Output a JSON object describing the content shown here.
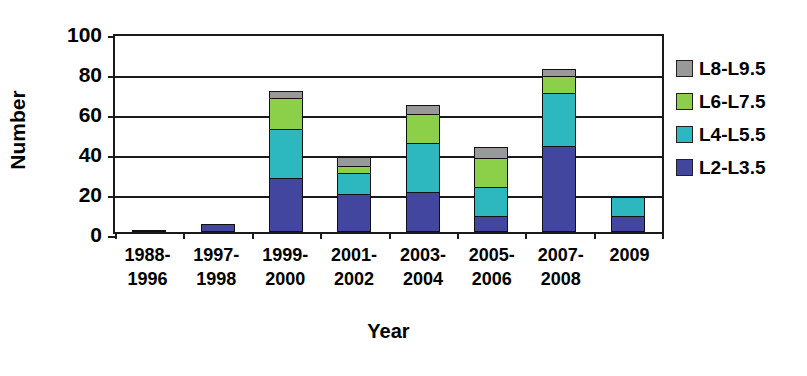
{
  "chart_data": {
    "type": "bar",
    "subtype": "stacked-vertical",
    "title": "",
    "xlabel": "Year",
    "ylabel": "Number",
    "ylim": [
      0,
      100
    ],
    "yticks": [
      0,
      20,
      40,
      60,
      80,
      100
    ],
    "grid": true,
    "legend_position": "right",
    "categories": [
      "1988-\n1996",
      "1997-\n1998",
      "1999-\n2000",
      "2001-\n2002",
      "2003-\n2004",
      "2005-\n2006",
      "2007-\n2008",
      "2009"
    ],
    "series": [
      {
        "name": "L2-L3.5",
        "color": "#42469e",
        "values": [
          1,
          4,
          27,
          19,
          20,
          8,
          43,
          8
        ]
      },
      {
        "name": "L4-L5.5",
        "color": "#2cb8be",
        "values": [
          0,
          0,
          25,
          11,
          25,
          15,
          27,
          10
        ]
      },
      {
        "name": "L6-L7.5",
        "color": "#8cd04a",
        "values": [
          0,
          0,
          16,
          4,
          15,
          15,
          9,
          0
        ]
      },
      {
        "name": "L8-L9.5",
        "color": "#999999",
        "values": [
          0,
          0,
          4,
          5,
          5,
          6,
          4,
          0
        ]
      }
    ],
    "totals": [
      1,
      4,
      72,
      39,
      65,
      44,
      83,
      18
    ]
  },
  "legend": {
    "items": [
      {
        "label": "L8-L9.5",
        "color": "#999999"
      },
      {
        "label": "L6-L7.5",
        "color": "#8cd04a"
      },
      {
        "label": "L4-L5.5",
        "color": "#2cb8be"
      },
      {
        "label": "L2-L3.5",
        "color": "#42469e"
      }
    ]
  },
  "axes": {
    "y_title": "Number",
    "x_title": "Year",
    "y_tick_labels": [
      "100",
      "80",
      "60",
      "40",
      "20",
      "0"
    ]
  },
  "colors": {
    "axis": "#1a1a1a",
    "background": "#ffffff",
    "text": "#000000"
  }
}
